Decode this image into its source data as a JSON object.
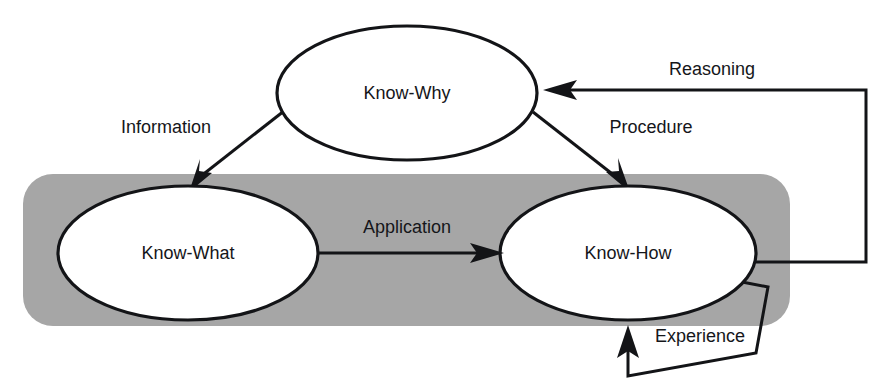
{
  "diagram": {
    "background_color": "#ffffff",
    "region": {
      "name": "operational-knowledge-region",
      "fill_color": "#a6a6a6",
      "label": ""
    },
    "nodes": [
      {
        "id": "know-why",
        "label": "Know-Why",
        "cx": 407,
        "cy": 93,
        "rx": 130,
        "ry": 67,
        "fill": "#ffffff",
        "stroke": "#131417"
      },
      {
        "id": "know-what",
        "label": "Know-What",
        "cx": 188,
        "cy": 253,
        "rx": 130,
        "ry": 67,
        "fill": "#ffffff",
        "stroke": "#131417"
      },
      {
        "id": "know-how",
        "label": "Know-How",
        "cx": 628,
        "cy": 253,
        "rx": 128,
        "ry": 67,
        "fill": "#ffffff",
        "stroke": "#131417"
      }
    ],
    "edges": [
      {
        "id": "information",
        "label": "Information",
        "from": "know-why",
        "to": "know-what",
        "label_x": 166,
        "label_y": 128
      },
      {
        "id": "procedure",
        "label": "Procedure",
        "from": "know-why",
        "to": "know-how",
        "label_x": 651,
        "label_y": 128
      },
      {
        "id": "application",
        "label": "Application",
        "from": "know-what",
        "to": "know-how",
        "label_x": 407,
        "label_y": 228
      },
      {
        "id": "reasoning",
        "label": "Reasoning",
        "from": "know-how",
        "to": "know-why",
        "label_x": 712,
        "label_y": 70
      },
      {
        "id": "experience",
        "label": "Experience",
        "from": "know-how",
        "to": "know-how",
        "label_x": 700,
        "label_y": 337
      }
    ]
  }
}
